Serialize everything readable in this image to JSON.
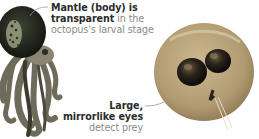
{
  "annotations": {
    "mantle": {
      "line1": "Mantle (body) is",
      "line2_bold": "transparent",
      "line2_rest": " in the",
      "line3": "octopus's larval stage"
    },
    "eyes": {
      "line1": "Large,",
      "line2": "mirrorlike eyes",
      "line3": "detect prey"
    }
  },
  "images": {
    "left": "adult-octopus-illustration",
    "right": "octopus-larva-photo"
  },
  "colors": {
    "text_dark": "#2b2b2b",
    "text_light": "#8a8a8a",
    "leader_line": "#9a9a9a",
    "octopus_body": "#2a2f24",
    "octopus_tentacles": "#7d7a68",
    "larva_body": "#b9a27a",
    "larva_eyes": "#1c1a16"
  }
}
